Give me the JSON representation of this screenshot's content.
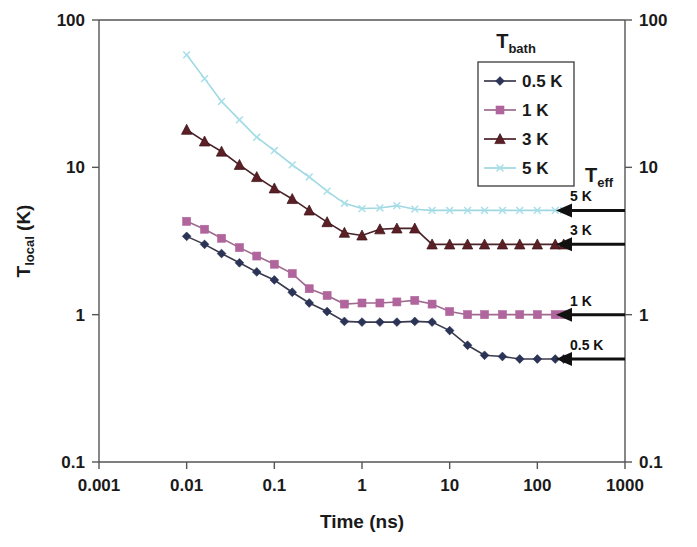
{
  "chart_data": {
    "type": "line",
    "title": "",
    "xlabel": "Time (ns)",
    "ylabel": "Tlocal (K)",
    "ylabel_main": "T",
    "ylabel_sub": "local",
    "ylabel_unit": " (K)",
    "xscale": "log",
    "yscale": "log",
    "xlim": [
      0.001,
      1000
    ],
    "ylim": [
      0.1,
      100
    ],
    "grid": false,
    "xticks": [
      0.001,
      0.01,
      0.1,
      1,
      10,
      100,
      1000
    ],
    "xtick_labels": [
      "0.001",
      "0.01",
      "0.1",
      "1",
      "10",
      "100",
      "1000"
    ],
    "yticks": [
      0.1,
      1,
      10,
      100
    ],
    "ytick_labels": [
      "0.1",
      "1",
      "10",
      "100"
    ],
    "ytick_labels_right": [
      "0.1",
      "1",
      "10",
      "100"
    ],
    "legend_title": "T",
    "legend_title_sub": "bath",
    "legend_position": "top-right-inside",
    "series": [
      {
        "name": "0.5 K",
        "label": "0.5 K",
        "color": "#2b3356",
        "marker": "diamond",
        "x": [
          0.01,
          0.016,
          0.025,
          0.04,
          0.063,
          0.1,
          0.16,
          0.25,
          0.4,
          0.63,
          1.0,
          1.6,
          2.5,
          4.0,
          6.3,
          10,
          16,
          25,
          40,
          63,
          100,
          160,
          200
        ],
        "y": [
          3.4,
          3.0,
          2.6,
          2.25,
          1.95,
          1.72,
          1.42,
          1.2,
          1.05,
          0.9,
          0.89,
          0.89,
          0.89,
          0.9,
          0.89,
          0.78,
          0.62,
          0.53,
          0.52,
          0.5,
          0.5,
          0.5,
          0.5
        ]
      },
      {
        "name": "1 K",
        "label": "1 K",
        "color": "#b0659c",
        "marker": "square",
        "x": [
          0.01,
          0.016,
          0.025,
          0.04,
          0.063,
          0.1,
          0.16,
          0.25,
          0.4,
          0.63,
          1.0,
          1.6,
          2.5,
          4.0,
          6.3,
          10,
          16,
          25,
          40,
          63,
          100,
          160,
          200
        ],
        "y": [
          4.3,
          3.8,
          3.3,
          2.85,
          2.5,
          2.2,
          1.9,
          1.5,
          1.35,
          1.18,
          1.2,
          1.2,
          1.22,
          1.25,
          1.18,
          1.05,
          1.0,
          1.0,
          1.0,
          1.0,
          1.0,
          1.0,
          1.0
        ]
      },
      {
        "name": "3 K",
        "label": "3 K",
        "color": "#5c1f26",
        "marker": "triangle",
        "x": [
          0.01,
          0.016,
          0.025,
          0.04,
          0.063,
          0.1,
          0.16,
          0.25,
          0.4,
          0.63,
          1.0,
          1.6,
          2.5,
          4.0,
          6.3,
          10,
          16,
          25,
          40,
          63,
          100,
          160,
          200
        ],
        "y": [
          18.0,
          15.0,
          12.8,
          10.4,
          8.6,
          7.2,
          6.1,
          5.1,
          4.25,
          3.6,
          3.45,
          3.8,
          3.85,
          3.85,
          3.0,
          3.0,
          3.0,
          3.0,
          3.0,
          3.0,
          3.0,
          3.0,
          3.0
        ]
      },
      {
        "name": "5 K",
        "label": "5 K",
        "color": "#a8dfe8",
        "marker": "cross",
        "x": [
          0.01,
          0.016,
          0.025,
          0.04,
          0.063,
          0.1,
          0.16,
          0.25,
          0.4,
          0.63,
          1.0,
          1.6,
          2.5,
          4.0,
          6.3,
          10,
          16,
          25,
          40,
          63,
          100,
          160,
          200
        ],
        "y": [
          58.0,
          40.0,
          28.0,
          21.0,
          16.0,
          13.0,
          10.4,
          8.6,
          6.9,
          5.7,
          5.25,
          5.3,
          5.5,
          5.2,
          5.1,
          5.1,
          5.1,
          5.1,
          5.1,
          5.1,
          5.1,
          5.1,
          5.1
        ]
      }
    ],
    "annotations": {
      "group_label_main": "T",
      "group_label_sub": "eff",
      "arrows": [
        {
          "label": "5 K",
          "value": 5.1
        },
        {
          "label": "3 K",
          "value": 3.0
        },
        {
          "label": "1 K",
          "value": 1.0
        },
        {
          "label": "0.5 K",
          "value": 0.5
        }
      ]
    }
  }
}
